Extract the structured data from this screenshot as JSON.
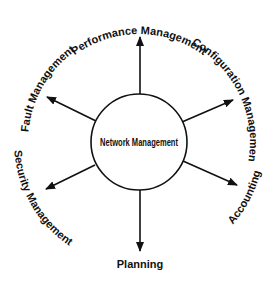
{
  "diagram": {
    "center_node": {
      "label": "Network Management"
    },
    "branches": [
      {
        "id": "performance",
        "label": "Performance Management",
        "direction": "up"
      },
      {
        "id": "configuration",
        "label": "Configuration Management",
        "direction": "up-right"
      },
      {
        "id": "accounting",
        "label": "Accounting",
        "direction": "down-right"
      },
      {
        "id": "planning",
        "label": "Planning",
        "direction": "down"
      },
      {
        "id": "security",
        "label": "Security Management",
        "direction": "down-left"
      },
      {
        "id": "fault",
        "label": "Fault Management",
        "direction": "up-left"
      }
    ],
    "colors": {
      "stroke": "#111111",
      "background": "#ffffff"
    }
  }
}
